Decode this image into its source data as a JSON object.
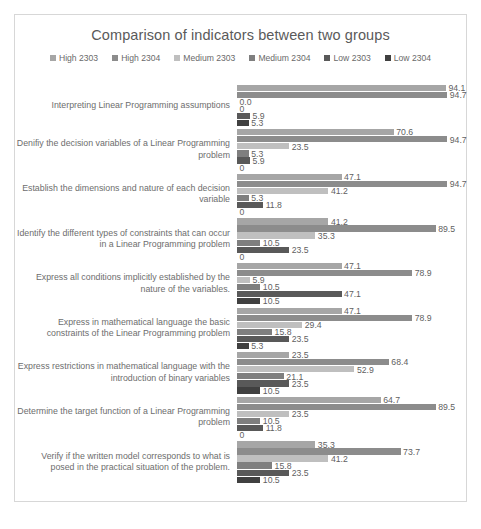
{
  "chart_data": {
    "type": "bar",
    "orientation": "horizontal",
    "title": "Comparison of indicators between two groups",
    "xlabel": "",
    "ylabel": "",
    "grid": false,
    "legend_position": "top",
    "xlim": [
      0,
      100
    ],
    "axis_ticks_visible": false,
    "colors": {
      "High 2303": "#a6a6a6",
      "High 2304": "#8c8c8c",
      "Medium 2303": "#bfbfbf",
      "Medium 2304": "#7f7f7f",
      "Low 2303": "#595959",
      "Low 2304": "#404040"
    },
    "series_names": [
      "High 2303",
      "High 2304",
      "Medium 2303",
      "Medium 2304",
      "Low 2303",
      "Low 2304"
    ],
    "categories": [
      "Interpreting Linear Programming assumptions",
      "Denifiy the decision variables of a Linear Programming problem",
      "Establish the dimensions and nature of each decision variable",
      "Identify the different types of constraints that can occur in a Linear Programming problem",
      "Express all conditions implicitly established by the nature of the variables.",
      "Express in mathematical language the basic constraints of the Linear Programming problem",
      "Express restrictions in mathematical language with the introduction of binary variables",
      "Determine the target function of a Linear Programming problem",
      "Verify if the written model corresponds to what is posed in the practical situation of the problem."
    ],
    "series": [
      {
        "name": "High 2303",
        "values": [
          94.1,
          70.6,
          47.1,
          41.2,
          47.1,
          47.1,
          23.5,
          64.7,
          35.3
        ]
      },
      {
        "name": "High 2304",
        "values": [
          94.7,
          94.7,
          94.7,
          89.5,
          78.9,
          78.9,
          68.4,
          89.5,
          73.7
        ]
      },
      {
        "name": "Medium 2303",
        "values": [
          0.0,
          23.5,
          41.2,
          35.3,
          5.9,
          29.4,
          52.9,
          23.5,
          41.2
        ]
      },
      {
        "name": "Medium 2304",
        "values": [
          0,
          5.3,
          5.3,
          10.5,
          10.5,
          15.8,
          21.1,
          10.5,
          15.8
        ]
      },
      {
        "name": "Low 2303",
        "values": [
          5.9,
          5.9,
          11.8,
          23.5,
          47.1,
          23.5,
          23.5,
          11.8,
          23.5
        ]
      },
      {
        "name": "Low 2304",
        "values": [
          5.3,
          0,
          0,
          0,
          10.5,
          5.3,
          10.5,
          0,
          10.5
        ]
      }
    ],
    "value_labels": [
      [
        "94.1",
        "94.7",
        "0.0",
        "0",
        "5.9",
        "5.3"
      ],
      [
        "70.6",
        "94.7",
        "23.5",
        "5.3",
        "5.9",
        "0"
      ],
      [
        "47.1",
        "94.7",
        "41.2",
        "5.3",
        "11.8",
        "0"
      ],
      [
        "41.2",
        "89.5",
        "35.3",
        "10.5",
        "23.5",
        "0"
      ],
      [
        "47.1",
        "78.9",
        "5.9",
        "10.5",
        "47.1",
        "10.5"
      ],
      [
        "47.1",
        "78.9",
        "29.4",
        "15.8",
        "23.5",
        "5.3"
      ],
      [
        "23.5",
        "68.4",
        "52.9",
        "21.1",
        "23.5",
        "10.5"
      ],
      [
        "64.7",
        "89.5",
        "23.5",
        "10.5",
        "11.8",
        "0"
      ],
      [
        "35.3",
        "73.7",
        "41.2",
        "15.8",
        "23.5",
        "10.5"
      ]
    ]
  },
  "legend": {
    "items": [
      {
        "label": "High 2303",
        "color": "#a6a6a6"
      },
      {
        "label": "High 2304",
        "color": "#8c8c8c"
      },
      {
        "label": "Medium 2303",
        "color": "#bfbfbf"
      },
      {
        "label": "Medium 2304",
        "color": "#7f7f7f"
      },
      {
        "label": "Low 2303",
        "color": "#595959"
      },
      {
        "label": "Low 2304",
        "color": "#404040"
      }
    ]
  }
}
